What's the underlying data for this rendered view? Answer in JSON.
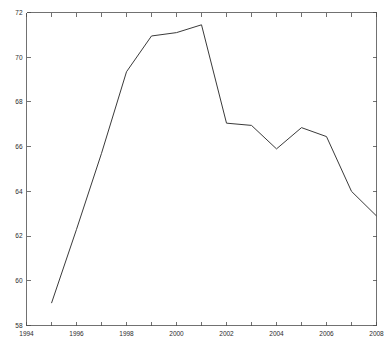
{
  "chart_data": {
    "type": "line",
    "title": "",
    "subtitle": "",
    "xlabel": "",
    "ylabel": "",
    "xlim": [
      1994,
      2008
    ],
    "ylim": [
      58,
      72
    ],
    "grid": false,
    "legend": null,
    "x": [
      1995,
      1996,
      1997,
      1998,
      1999,
      2000,
      2001,
      2002,
      2003,
      2004,
      2005,
      2006,
      2007,
      2008
    ],
    "series": [
      {
        "name": "series-1",
        "color": "#3a3a3a",
        "values": [
          59.0,
          62.3,
          65.7,
          69.35,
          70.95,
          71.1,
          71.45,
          67.05,
          66.95,
          65.9,
          66.85,
          66.45,
          64.0,
          62.9
        ]
      }
    ],
    "x_ticks": [
      1994,
      1995,
      1996,
      1997,
      1998,
      1999,
      2000,
      2001,
      2002,
      2003,
      2004,
      2005,
      2006,
      2007,
      2008
    ],
    "x_tick_labels": [
      "1994",
      "",
      "1996",
      "",
      "1998",
      "",
      "2000",
      "",
      "2002",
      "",
      "2004",
      "",
      "2006",
      "",
      "2008"
    ],
    "y_ticks": [
      58,
      60,
      62,
      64,
      66,
      68,
      70,
      72
    ],
    "y_tick_labels": [
      "58",
      "60",
      "62",
      "64",
      "66",
      "68",
      "70",
      "72"
    ]
  },
  "axes": {
    "x_tick_labels": [
      "1994",
      "1996",
      "1998",
      "2000",
      "2002",
      "2004",
      "2006",
      "2008"
    ],
    "y_tick_labels": [
      "58",
      "60",
      "62",
      "64",
      "66",
      "68",
      "70",
      "72"
    ]
  },
  "colors": {
    "line": "#3a3a3a",
    "axis": "#4d4d4d",
    "background": "#ffffff",
    "text": "#2b2b2b"
  }
}
